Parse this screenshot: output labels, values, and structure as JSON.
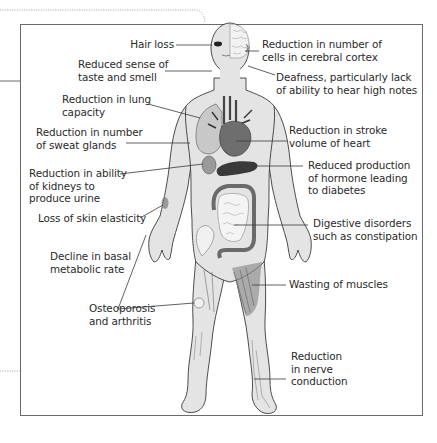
{
  "diagram": {
    "type": "anatomical-annotation",
    "colors": {
      "frame": "#6b6b6b",
      "dotted_frame": "#9a9a9a",
      "body_fill": "#e2e2e2",
      "body_outline": "#3a3a3a",
      "organ_dark": "#4a4a4a",
      "organ_mid": "#7a7a7a",
      "leader_line": "#3a3a3a",
      "text": "#2a2a2a"
    },
    "labels": {
      "hair_loss": "Hair loss",
      "taste_smell": "Reduced sense of\ntaste and smell",
      "lung_capacity": "Reduction in lung\ncapacity",
      "sweat_glands": "Reduction in number\nof sweat glands",
      "kidneys": "Reduction in ability\nof kidneys to\nproduce urine",
      "skin_elasticity": "Loss of skin elasticity",
      "basal_metabolic": "Decline in basal\nmetabolic rate",
      "osteoporosis": "Osteoporosis\nand arthritis",
      "cerebral_cortex": "Reduction in number of\ncells in cerebral cortex",
      "deafness": "Deafness, particularly lack\nof ability to hear high notes",
      "stroke_volume": "Reduction in stroke\nvolume of heart",
      "hormone_diabetes": "Reduced production\nof hormone leading\nto diabetes",
      "digestive": "Digestive disorders\nsuch as constipation",
      "muscle_wasting": "Wasting of muscles",
      "nerve_conduction": "Reduction\nin nerve\nconduction"
    }
  }
}
